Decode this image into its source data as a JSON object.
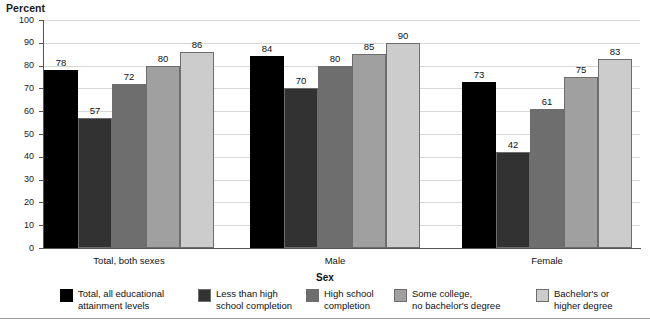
{
  "chart_data": {
    "type": "bar",
    "title": "",
    "ylabel": "Percent",
    "xlabel": "Sex",
    "categories": [
      "Total, both sexes",
      "Male",
      "Female"
    ],
    "series": [
      {
        "name": "Total, all educational attainment levels",
        "color": "#000000",
        "values": [
          78,
          84,
          73
        ]
      },
      {
        "name": "Less than high school completion",
        "color": "#323232",
        "values": [
          57,
          70,
          42
        ]
      },
      {
        "name": "High school completion",
        "color": "#6e6e6e",
        "values": [
          72,
          80,
          61
        ]
      },
      {
        "name": "Some college, no bachelor's degree",
        "color": "#a0a0a0",
        "values": [
          80,
          85,
          75
        ]
      },
      {
        "name": "Bachelor's or higher degree",
        "color": "#cccccc",
        "values": [
          86,
          90,
          83
        ]
      }
    ],
    "ylim": [
      0,
      100
    ],
    "yticks": [
      0,
      10,
      20,
      30,
      40,
      50,
      60,
      70,
      80,
      90,
      100
    ],
    "ytick_labels": [
      "0",
      "10",
      "20",
      "30",
      "40",
      "50",
      "60",
      "70",
      "80",
      "90",
      "100"
    ],
    "grid": true,
    "legend_position": "bottom",
    "data_labels": true
  },
  "axes": {
    "y_title": "Percent",
    "x_title": "Sex"
  },
  "legend": {
    "items": [
      {
        "label_line1": "Total, all educational",
        "label_line2": "attainment levels",
        "color": "#000000"
      },
      {
        "label_line1": "Less than high",
        "label_line2": "school completion",
        "color": "#323232"
      },
      {
        "label_line1": "High school",
        "label_line2": "completion",
        "color": "#6e6e6e"
      },
      {
        "label_line1": "Some college,",
        "label_line2": "no bachelor's degree",
        "color": "#a0a0a0"
      },
      {
        "label_line1": "Bachelor's or",
        "label_line2": "higher degree",
        "color": "#cccccc"
      }
    ]
  },
  "groups": [
    {
      "label": "Total, both sexes",
      "bars": [
        {
          "value": 78,
          "label": "78"
        },
        {
          "value": 57,
          "label": "57"
        },
        {
          "value": 72,
          "label": "72"
        },
        {
          "value": 80,
          "label": "80"
        },
        {
          "value": 86,
          "label": "86"
        }
      ]
    },
    {
      "label": "Male",
      "bars": [
        {
          "value": 84,
          "label": "84"
        },
        {
          "value": 70,
          "label": "70"
        },
        {
          "value": 80,
          "label": "80"
        },
        {
          "value": 85,
          "label": "85"
        },
        {
          "value": 90,
          "label": "90"
        }
      ]
    },
    {
      "label": "Female",
      "bars": [
        {
          "value": 73,
          "label": "73"
        },
        {
          "value": 42,
          "label": "42"
        },
        {
          "value": 61,
          "label": "61"
        },
        {
          "value": 75,
          "label": "75"
        },
        {
          "value": 83,
          "label": "83"
        }
      ]
    }
  ]
}
